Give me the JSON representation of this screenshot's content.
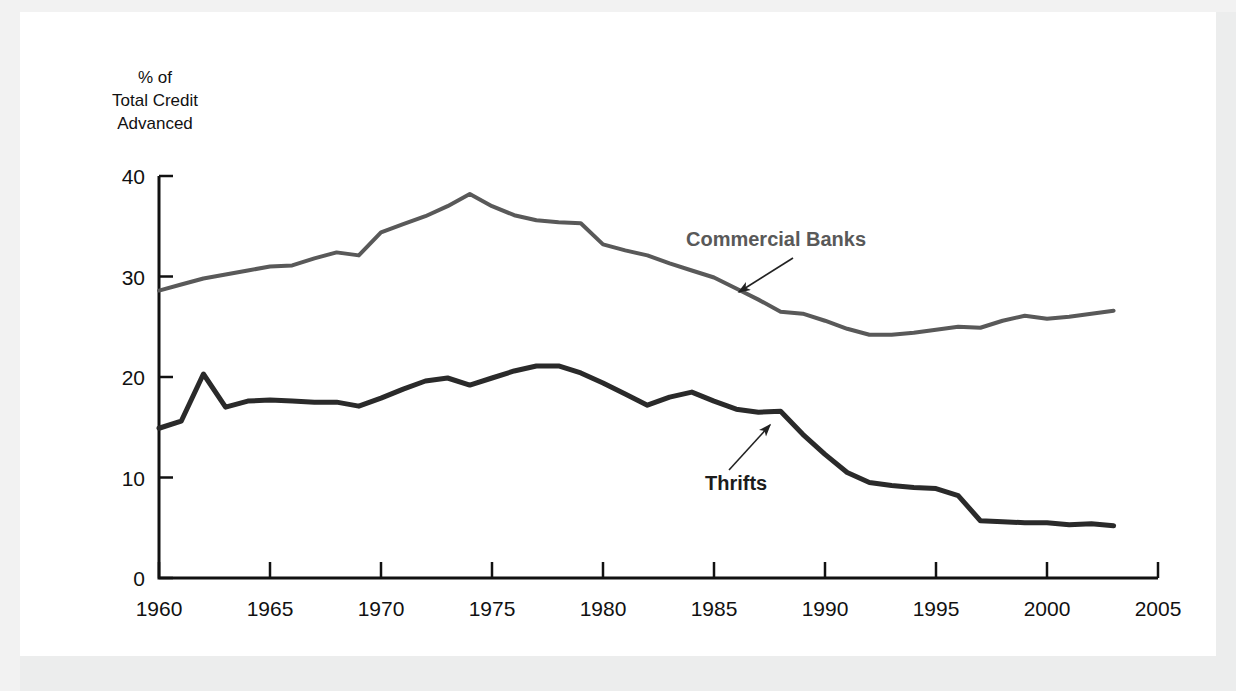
{
  "figure": {
    "background_color": "#f2f2f2",
    "plate_color": "#ffffff"
  },
  "chart_data": {
    "type": "line",
    "title": "",
    "subtitle": "",
    "xlabel": "",
    "ylabel": "% of\nTotal Credit\nAdvanced",
    "ylabel_lines": [
      "% of",
      "Total Credit",
      "Advanced"
    ],
    "xlim": [
      1960,
      2005
    ],
    "ylim": [
      0,
      40
    ],
    "yticks": [
      0,
      10,
      20,
      30,
      40
    ],
    "ytick_labels": [
      "0",
      "10",
      "20",
      "30",
      "40"
    ],
    "xticks": [
      1960,
      1965,
      1970,
      1975,
      1980,
      1985,
      1990,
      1995,
      2000,
      2005
    ],
    "xtick_labels": [
      "1960",
      "1965",
      "1970",
      "1975",
      "1980",
      "1985",
      "1990",
      "1995",
      "2000",
      "2005"
    ],
    "grid": false,
    "legend_position": "inline-annotations",
    "x": [
      1960,
      1961,
      1962,
      1963,
      1964,
      1965,
      1966,
      1967,
      1968,
      1969,
      1970,
      1971,
      1972,
      1973,
      1974,
      1975,
      1976,
      1977,
      1978,
      1979,
      1980,
      1981,
      1982,
      1983,
      1984,
      1985,
      1986,
      1987,
      1988,
      1989,
      1990,
      1991,
      1992,
      1993,
      1994,
      1995,
      1996,
      1997,
      1998,
      1999,
      2000,
      2001,
      2002,
      2003
    ],
    "series": [
      {
        "name": "Commercial Banks",
        "color": "#595959",
        "line_width": 4,
        "values": [
          28.6,
          29.2,
          29.8,
          30.2,
          30.6,
          31.0,
          31.1,
          31.8,
          32.4,
          32.1,
          34.4,
          35.2,
          36.0,
          37.0,
          38.2,
          37.0,
          36.1,
          35.6,
          35.4,
          35.3,
          33.2,
          32.6,
          32.1,
          31.3,
          30.6,
          29.9,
          28.8,
          27.7,
          26.5,
          26.3,
          25.6,
          24.8,
          24.2,
          24.2,
          24.4,
          24.7,
          25.0,
          24.9,
          25.6,
          26.1,
          25.8,
          26.0,
          26.3,
          26.6
        ]
      },
      {
        "name": "Thrifts",
        "color": "#2a2a2a",
        "line_width": 5,
        "values": [
          14.9,
          15.6,
          20.3,
          17.0,
          17.6,
          17.7,
          17.6,
          17.5,
          17.5,
          17.1,
          17.9,
          18.8,
          19.6,
          19.9,
          19.2,
          19.9,
          20.6,
          21.1,
          21.1,
          20.4,
          19.4,
          18.3,
          17.2,
          18.0,
          18.5,
          17.6,
          16.8,
          16.5,
          16.6,
          14.3,
          12.3,
          10.5,
          9.5,
          9.2,
          9.0,
          8.9,
          8.2,
          5.7,
          5.6,
          5.5,
          5.5,
          5.3,
          5.4,
          5.2
        ]
      }
    ],
    "annotations": [
      {
        "label": "Commercial Banks",
        "text_x": 686,
        "text_y": 246,
        "color": "#595959",
        "arrow_from_x": 793,
        "arrow_from_y": 258,
        "arrow_to_x": 739,
        "arrow_to_y": 292
      },
      {
        "label": "Thrifts",
        "text_x": 705,
        "text_y": 490,
        "color": "#1c1c1c",
        "arrow_from_x": 729,
        "arrow_from_y": 470,
        "arrow_to_x": 770,
        "arrow_to_y": 425
      }
    ]
  }
}
